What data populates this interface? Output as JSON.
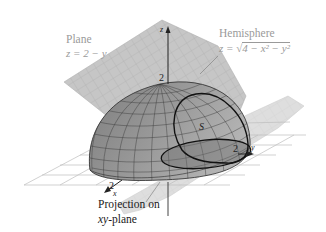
{
  "figure": {
    "plane_label": {
      "title": "Plane",
      "equation": "z = 2 − y"
    },
    "hemisphere_label": {
      "title": "Hemisphere",
      "equation_lhs": "z = √",
      "equation_radicand": "4 − x² − y²"
    },
    "surface_label": "S",
    "projection_label": {
      "line1": "Projection on",
      "line2_var": "xy",
      "line2_rest": "-plane"
    },
    "axes": {
      "x": {
        "label": "x",
        "tick": "2"
      },
      "y": {
        "label": "y",
        "tick": "2"
      },
      "z": {
        "label": "z",
        "tick": "2"
      }
    },
    "colors": {
      "plane_fill": "#c4c4c4",
      "plane_grid": "#a8a8a8",
      "hemisphere_fill": "#8e8e8e",
      "hemisphere_grid": "#3c3c3c",
      "xy_grid": "#b5b5b5",
      "curve": "#111111",
      "label_gray": "#9a9a9a"
    }
  }
}
